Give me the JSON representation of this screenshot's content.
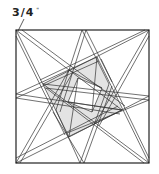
{
  "diagram": {
    "type": "quilt-block-pattern",
    "seam_label": "3/4",
    "seam_unit": "\"",
    "colors": {
      "line": "#333333",
      "fill_gray": "#e3e3e3",
      "background": "#ffffff"
    },
    "block": {
      "x": 16,
      "y": 30,
      "size": 133
    }
  }
}
